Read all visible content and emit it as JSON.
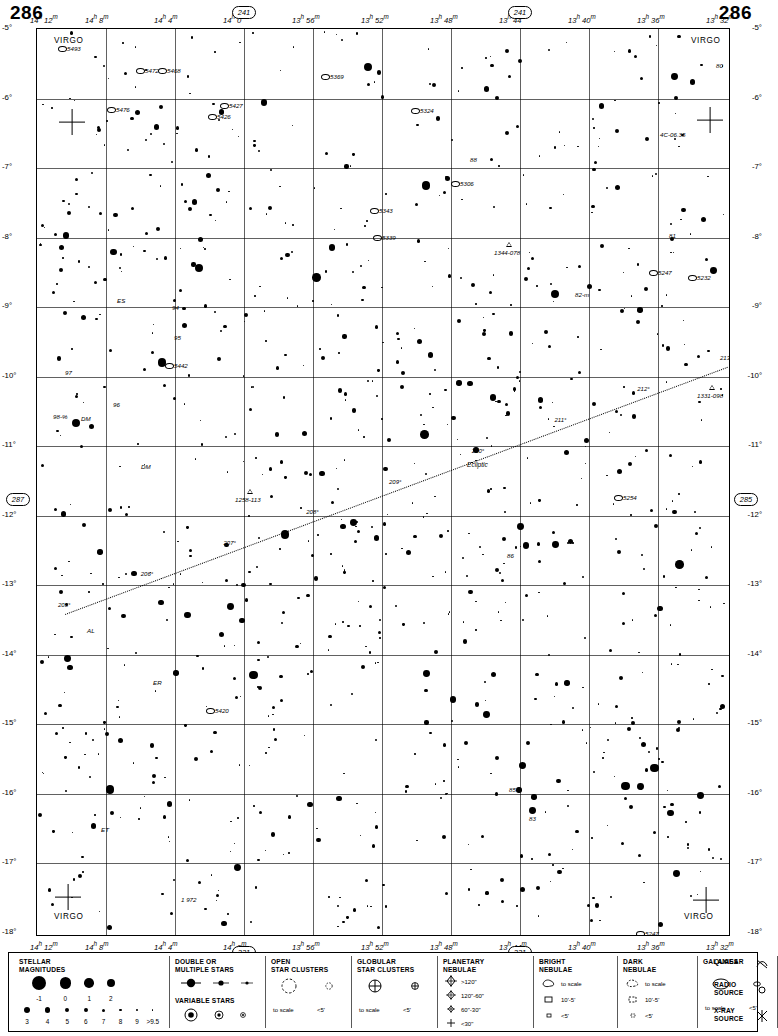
{
  "page": {
    "number_left": "286",
    "number_right": "286"
  },
  "chart_data": {
    "type": "scatter",
    "xlabel": "Right Ascension",
    "ylabel": "Declination",
    "ra_ticks_top": [
      "14h 12m",
      "14h 8m",
      "14h 4m",
      "14h 0m",
      "13h 56m",
      "13h 52m",
      "13h 48m",
      "13h 44m",
      "13h 40m",
      "13h 36m",
      "13h 32m"
    ],
    "ra_ticks_bottom": [
      "14h 12m",
      "14h 8m",
      "14h 4m",
      "14h 0m",
      "13h 56m",
      "13h 52m",
      "13h 48m",
      "13h 44m",
      "13h 40m",
      "13h 36m",
      "13h 32m"
    ],
    "dec_ticks_left": [
      "-5°",
      "-6°",
      "-7°",
      "-8°",
      "-9°",
      "-10°",
      "-11°",
      "-12°",
      "-13°",
      "-14°",
      "-15°",
      "-16°",
      "-17°",
      "-18°"
    ],
    "dec_ticks_right": [
      "-5°",
      "-6°",
      "-7°",
      "-8°",
      "-9°",
      "-10°",
      "-11°",
      "-12°",
      "-13°",
      "-14°",
      "-15°",
      "-16°",
      "-17°",
      "-18°"
    ],
    "adjacent_charts": {
      "top_left": "241",
      "top_right": "241",
      "left": "287",
      "right": "285",
      "bottom_left": "331",
      "bottom_right": "331"
    },
    "constellation_labels": [
      "VIRGO",
      "VIRGO",
      "VIRGO",
      "VIRGO"
    ],
    "ecliptic_label": "Ecliptic",
    "ecliptic_ticks": [
      "205°",
      "206°",
      "207°",
      "208°",
      "209°",
      "210°",
      "211°",
      "212°",
      "213°"
    ],
    "objects": [
      {
        "label": "5493",
        "x": 30,
        "y": 16
      },
      {
        "label": "5472",
        "x": 108,
        "y": 38
      },
      {
        "label": "5468",
        "x": 130,
        "y": 38
      },
      {
        "label": "5369",
        "x": 293,
        "y": 44
      },
      {
        "label": "5476",
        "x": 79,
        "y": 77
      },
      {
        "label": "5427",
        "x": 192,
        "y": 73
      },
      {
        "label": "5426",
        "x": 180,
        "y": 84
      },
      {
        "label": "5324",
        "x": 383,
        "y": 78
      },
      {
        "label": "4C-06.35",
        "x": 623,
        "y": 102
      },
      {
        "label": "88",
        "x": 433,
        "y": 127
      },
      {
        "label": "7L-12",
        "x": 705,
        "y": 94
      },
      {
        "label": "80",
        "x": 679,
        "y": 33
      },
      {
        "label": "5306",
        "x": 423,
        "y": 151
      },
      {
        "label": "5343",
        "x": 342,
        "y": 178
      },
      {
        "label": "5339",
        "x": 345,
        "y": 205
      },
      {
        "label": "1344-078",
        "x": 457,
        "y": 220
      },
      {
        "label": "S",
        "x": 708,
        "y": 156
      },
      {
        "label": "77",
        "x": 710,
        "y": 186
      },
      {
        "label": "81",
        "x": 632,
        "y": 203
      },
      {
        "label": "5247",
        "x": 621,
        "y": 240
      },
      {
        "label": "5232",
        "x": 660,
        "y": 245
      },
      {
        "label": "5203",
        "x": 706,
        "y": 265
      },
      {
        "label": "82-m",
        "x": 538,
        "y": 262
      },
      {
        "label": "ES",
        "x": 80,
        "y": 268
      },
      {
        "label": "94",
        "x": 135,
        "y": 275
      },
      {
        "label": "95",
        "x": 137,
        "y": 305
      },
      {
        "label": "5442",
        "x": 137,
        "y": 333
      },
      {
        "label": "97",
        "x": 28,
        "y": 340
      },
      {
        "label": "96",
        "x": 76,
        "y": 372
      },
      {
        "label": "98-%",
        "x": 16,
        "y": 384
      },
      {
        "label": "DM",
        "x": 44,
        "y": 386
      },
      {
        "label": "1331-098",
        "x": 660,
        "y": 363
      },
      {
        "label": "76-n",
        "x": 707,
        "y": 378
      },
      {
        "label": "DM",
        "x": 104,
        "y": 434
      },
      {
        "label": "1258-113",
        "x": 198,
        "y": 467
      },
      {
        "label": "5254",
        "x": 586,
        "y": 465
      },
      {
        "label": "86",
        "x": 470,
        "y": 523
      },
      {
        "label": "y",
        "x": 706,
        "y": 582
      },
      {
        "label": "ER",
        "x": 116,
        "y": 650
      },
      {
        "label": "5420",
        "x": 178,
        "y": 678
      },
      {
        "label": "75",
        "x": 694,
        "y": 735
      },
      {
        "label": "85",
        "x": 472,
        "y": 757
      },
      {
        "label": "83",
        "x": 492,
        "y": 786
      },
      {
        "label": "ET",
        "x": 64,
        "y": 797
      },
      {
        "label": "1 972",
        "x": 144,
        "y": 867
      },
      {
        "label": "5247",
        "x": 608,
        "y": 901
      },
      {
        "label": "89",
        "x": 418,
        "y": 913
      },
      {
        "label": "27",
        "x": 440,
        "y": 908
      },
      {
        "label": "AL",
        "x": 50,
        "y": 598
      }
    ]
  },
  "legend": {
    "magnitudes": {
      "title_line1": "STELLAR",
      "title_line2": "MAGNITUDES",
      "top_labels": [
        "-1",
        "0",
        "1",
        "2"
      ],
      "bottom_labels": [
        "3",
        "4",
        "5",
        "6",
        "7",
        "8",
        "9",
        "9.5"
      ]
    },
    "double_stars": {
      "title_line1": "DOUBLE OR",
      "title_line2": "MULTIPLE STARS",
      "variable_title": "VARIABLE  STARS"
    },
    "open_clusters": {
      "title_line1": "OPEN",
      "title_line2": "STAR CLUSTERS",
      "scale_label": "to scale",
      "small_label": "<5'"
    },
    "globular_clusters": {
      "title_line1": "GLOBULAR",
      "title_line2": "STAR CLUSTERS",
      "scale_label": "to scale",
      "small_label": "<5'"
    },
    "planetary_nebula": {
      "title_line1": "PLANETARY",
      "title_line2": "NEBULAE",
      "rows": [
        ">120\"",
        "120\"-60\"",
        "60\"-30\"",
        "<30\""
      ]
    },
    "bright_nebulae": {
      "title_line1": "BRIGHT",
      "title_line2": "NEBULAE",
      "rows": [
        "to scale",
        "10'-5'",
        "<5'"
      ]
    },
    "dark_nebulae": {
      "title_line1": "DARK",
      "title_line2": "NEBULAE",
      "rows": [
        "to scale",
        "10'-5'",
        "<5'"
      ]
    },
    "galaxies": {
      "title": "GALAXIES",
      "scale_label": "to scale",
      "small_label": "<5'"
    },
    "other": {
      "quasar": "QUASAR",
      "radio_line1": "RADIO",
      "radio_line2": "SOURCE",
      "xray_line1": "X-RAY",
      "xray_line2": "SOURCE"
    }
  }
}
